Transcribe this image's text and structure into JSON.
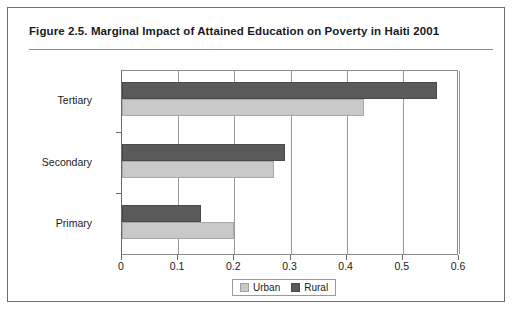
{
  "figure": {
    "title": "Figure 2.5.  Marginal Impact of Attained Education on Poverty in Haiti 2001"
  },
  "colors": {
    "urban": "#c9c9c9",
    "rural": "#5a5a5a",
    "frame": "#6f6f6f",
    "axis": "#8a8a8a"
  },
  "legend": {
    "position": "bottom",
    "entries": [
      {
        "label": "Urban",
        "color": "#c9c9c9"
      },
      {
        "label": "Rural",
        "color": "#5a5a5a"
      }
    ]
  },
  "chart_data": {
    "type": "bar",
    "orientation": "horizontal",
    "title": "Figure 2.5.  Marginal Impact of Attained Education on Poverty in Haiti 2001",
    "xlabel": "",
    "ylabel": "",
    "categories": [
      "Tertiary",
      "Secondary",
      "Primary"
    ],
    "series": [
      {
        "name": "Rural",
        "values": [
          0.56,
          0.29,
          0.14
        ],
        "color": "#5a5a5a"
      },
      {
        "name": "Urban",
        "values": [
          0.43,
          0.27,
          0.2
        ],
        "color": "#c9c9c9"
      }
    ],
    "xlim": [
      0,
      0.6
    ],
    "xticks": [
      0,
      0.1,
      0.2,
      0.3,
      0.4,
      0.5,
      0.6
    ],
    "xtick_labels": [
      "0",
      "0.1",
      "0.2",
      "0.3",
      "0.4",
      "0.5",
      "0.6"
    ],
    "grid": true,
    "grid_axis": "x",
    "legend_position": "bottom"
  }
}
